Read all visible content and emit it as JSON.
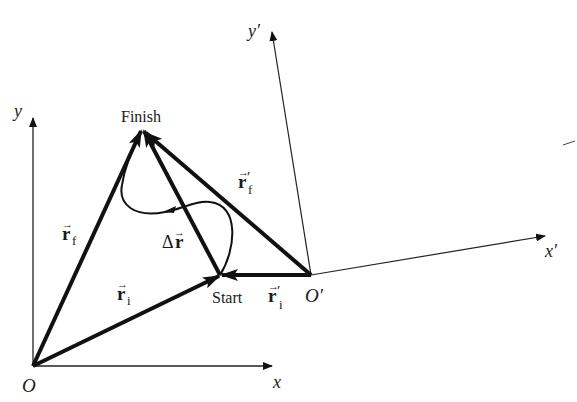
{
  "diagram": {
    "type": "position-vectors-two-frames",
    "colors": {
      "ink": "#111111",
      "background": "#ffffff"
    },
    "frames": {
      "unprimed": {
        "origin_label": "O",
        "x_label": "x",
        "y_label": "y"
      },
      "primed": {
        "origin_label": "O′",
        "x_label": "x′",
        "y_label": "y′"
      }
    },
    "points": {
      "finish": "Finish",
      "start": "Start"
    },
    "vectors": {
      "r_f": {
        "symbol": "r",
        "subscript": "f",
        "prime": ""
      },
      "r_i": {
        "symbol": "r",
        "subscript": "i",
        "prime": ""
      },
      "r_f_prime": {
        "symbol": "r",
        "subscript": "f",
        "prime": "′"
      },
      "r_i_prime": {
        "symbol": "r",
        "subscript": "i",
        "prime": "′"
      },
      "delta_r": {
        "prefix": "Δ",
        "symbol": "r"
      }
    },
    "arrow_glyph": "→"
  }
}
